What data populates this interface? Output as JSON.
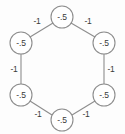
{
  "figure": {
    "name": "hexagonal-weighted-graph",
    "background_color": "#fdfdfd",
    "stroke_color": "#8d8d8d",
    "text_color": "#3a3a3a",
    "node_fill": "#ffffff"
  },
  "chart_data": {
    "type": "diagram",
    "title": "",
    "layout": "hexagonal cycle of 6 nodes",
    "nodes": [
      {
        "id": "n0",
        "label": "-.5",
        "cx": 62,
        "cy": 17,
        "r": 11
      },
      {
        "id": "n1",
        "label": "-.5",
        "cx": 104,
        "cy": 43,
        "r": 11
      },
      {
        "id": "n2",
        "label": "-.5",
        "cx": 104,
        "cy": 95,
        "r": 11
      },
      {
        "id": "n3",
        "label": "-.5",
        "cx": 62,
        "cy": 120,
        "r": 11
      },
      {
        "id": "n4",
        "label": "-.5",
        "cx": 21,
        "cy": 95,
        "r": 11
      },
      {
        "id": "n5",
        "label": "-.5",
        "cx": 21,
        "cy": 43,
        "r": 11
      }
    ],
    "edges": [
      {
        "id": "e0",
        "source": "n5",
        "target": "n0",
        "label": "-1",
        "lx": 37,
        "ly": 21,
        "x1": 30,
        "y1": 37,
        "x2": 53,
        "y2": 23
      },
      {
        "id": "e1",
        "source": "n0",
        "target": "n1",
        "label": "-1",
        "lx": 88,
        "ly": 21,
        "x1": 71,
        "y1": 23,
        "x2": 95,
        "y2": 37
      },
      {
        "id": "e2",
        "source": "n1",
        "target": "n2",
        "label": "-1",
        "lx": 111,
        "ly": 69,
        "x1": 104,
        "y1": 54,
        "x2": 104,
        "y2": 84
      },
      {
        "id": "e3",
        "source": "n2",
        "target": "n3",
        "label": "-1",
        "lx": 86,
        "ly": 114,
        "x1": 95,
        "y1": 101,
        "x2": 72,
        "y2": 115
      },
      {
        "id": "e4",
        "source": "n3",
        "target": "n4",
        "label": "-1",
        "lx": 38,
        "ly": 114,
        "x1": 52,
        "y1": 115,
        "x2": 30,
        "y2": 101
      },
      {
        "id": "e5",
        "source": "n4",
        "target": "n5",
        "label": "-1",
        "lx": 14,
        "ly": 69,
        "x1": 21,
        "y1": 84,
        "x2": 21,
        "y2": 54
      }
    ],
    "node_value": "-.5",
    "edge_weight": "-1",
    "node_count": 6,
    "edge_count": 6
  }
}
